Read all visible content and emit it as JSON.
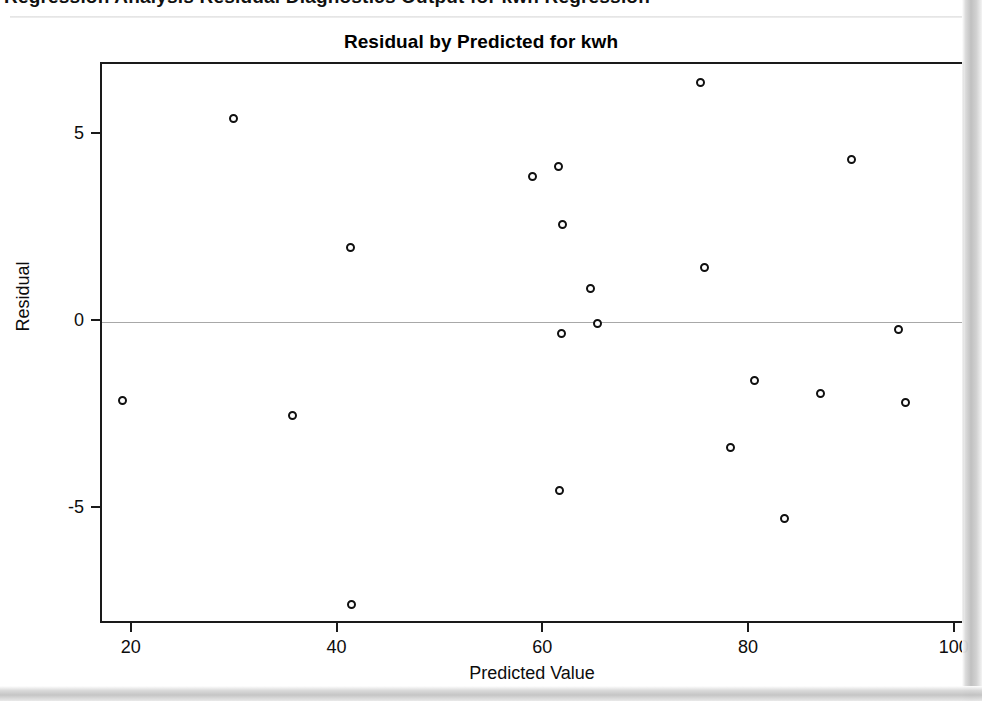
{
  "page": {
    "clipped_header_text": "Regression Analysis Residual Diagnostics Output for kwh Regression"
  },
  "chart_data": {
    "type": "scatter",
    "title": "Residual by Predicted for kwh",
    "xlabel": "Predicted Value",
    "ylabel": "Residual",
    "xlim": [
      17.0,
      101.0
    ],
    "ylim": [
      -8.1,
      6.9
    ],
    "xticks": [
      20,
      40,
      60,
      80,
      100
    ],
    "yticks": [
      5,
      0,
      -5
    ],
    "xtick_labels": [
      "20",
      "40",
      "60",
      "80",
      "100"
    ],
    "ytick_labels": [
      "5",
      "0",
      "-5"
    ],
    "grid": false,
    "legend": null,
    "reference_line": {
      "orientation": "horizontal",
      "y": 0,
      "color": "#a8a8a8"
    },
    "marker": {
      "shape": "open-circle",
      "size": 9,
      "edge_color": "#101010",
      "fill": "#ffffff"
    },
    "n_points": 23,
    "x": [
      19.0,
      29.8,
      35.5,
      41.2,
      41.3,
      58.9,
      61.4,
      61.8,
      61.7,
      61.5,
      64.5,
      65.2,
      65.1,
      75.2,
      75.6,
      78.1,
      80.4,
      83.4,
      86.9,
      89.9,
      94.4,
      95.1
    ],
    "y": [
      -2.1,
      5.45,
      -2.5,
      2.0,
      -7.55,
      3.9,
      4.15,
      2.6,
      -0.3,
      -4.5,
      0.9,
      -0.05,
      -0.05,
      6.4,
      1.45,
      -3.35,
      -1.55,
      -5.25,
      -1.9,
      4.35,
      -0.2,
      -2.15
    ],
    "points": [
      {
        "x": 19.0,
        "y": -2.1
      },
      {
        "x": 29.8,
        "y": 5.45
      },
      {
        "x": 35.5,
        "y": -2.5
      },
      {
        "x": 41.2,
        "y": 2.0
      },
      {
        "x": 41.3,
        "y": -7.55
      },
      {
        "x": 58.9,
        "y": 3.9
      },
      {
        "x": 61.4,
        "y": 4.15
      },
      {
        "x": 61.8,
        "y": 2.6
      },
      {
        "x": 61.7,
        "y": -0.3
      },
      {
        "x": 61.5,
        "y": -4.5
      },
      {
        "x": 64.5,
        "y": 0.9
      },
      {
        "x": 65.2,
        "y": -0.05
      },
      {
        "x": 75.2,
        "y": 6.4
      },
      {
        "x": 75.6,
        "y": 1.45
      },
      {
        "x": 78.1,
        "y": -3.35
      },
      {
        "x": 80.4,
        "y": -1.55
      },
      {
        "x": 83.4,
        "y": -5.25
      },
      {
        "x": 86.9,
        "y": -1.9
      },
      {
        "x": 89.9,
        "y": 4.35
      },
      {
        "x": 94.4,
        "y": -0.2
      },
      {
        "x": 95.1,
        "y": -2.15
      }
    ]
  }
}
